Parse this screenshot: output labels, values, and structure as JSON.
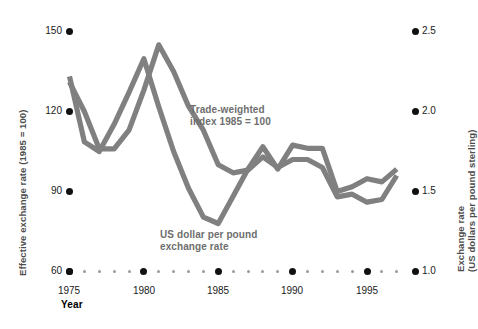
{
  "chart_data": {
    "type": "line",
    "title": "",
    "xlabel": "Year",
    "grid": false,
    "legend_position": "inline-annotations",
    "x": [
      1975,
      1976,
      1977,
      1978,
      1979,
      1980,
      1981,
      1982,
      1983,
      1984,
      1985,
      1986,
      1987,
      1988,
      1989,
      1990,
      1991,
      1992,
      1993,
      1994,
      1995,
      1996,
      1997
    ],
    "axes": {
      "left": {
        "label": "Effective exchange rate (1985 = 100)",
        "ticks": [
          60,
          90,
          120,
          150
        ],
        "tick_labels": [
          "60",
          "90",
          "120",
          "150"
        ],
        "lim": [
          60,
          150
        ]
      },
      "right": {
        "label_line1": "Exchange rate",
        "label_line2": "(US dollars per pound sterling)",
        "label": "Exchange rate (US dollars per pound sterling)",
        "ticks": [
          1.0,
          1.5,
          2.0,
          2.5
        ],
        "tick_labels": [
          "1.0",
          "1.5",
          "2.0",
          "2.5"
        ],
        "lim": [
          1.0,
          2.5
        ]
      },
      "x": {
        "major_ticks": [
          1975,
          1980,
          1985,
          1990,
          1995
        ],
        "major_tick_labels": [
          "1975",
          "1980",
          "1985",
          "1990",
          "1995"
        ],
        "minor_ticks": [
          1976,
          1977,
          1978,
          1979,
          1981,
          1982,
          1983,
          1984,
          1986,
          1987,
          1988,
          1989,
          1991,
          1992,
          1993,
          1994,
          1996,
          1997
        ],
        "lim": [
          1974,
          1997.5
        ]
      }
    },
    "series": [
      {
        "name": "Trade-weighted index 1985 = 100",
        "axis": "left",
        "color": "#808080",
        "annotation": "Trade-weighted\nindex 1985 = 100",
        "values": [
          131,
          120,
          106,
          106,
          113,
          128,
          145,
          135,
          122,
          113,
          100,
          97,
          98,
          103,
          99,
          102,
          102,
          99,
          88,
          89,
          86,
          87,
          96
        ]
      },
      {
        "name": "US dollar per pound exchange rate",
        "axis": "right",
        "color": "#808080",
        "annotation": "US dollar per pound\nexchange rate",
        "values": [
          2.22,
          1.81,
          1.75,
          1.92,
          2.12,
          2.33,
          2.03,
          1.75,
          1.52,
          1.34,
          1.3,
          1.47,
          1.64,
          1.78,
          1.64,
          1.79,
          1.77,
          1.77,
          1.5,
          1.53,
          1.58,
          1.56,
          1.64
        ]
      }
    ]
  },
  "labels": {
    "x_axis_title": "Year",
    "left_axis_title": "Effective exchange rate (1985 = 100)",
    "right_axis_title_line1": "Exchange rate",
    "right_axis_title_line2": "(US dollars per pound sterling)",
    "annotation_trade_weighted": "Trade-weighted\nindex 1985 = 100",
    "annotation_us_dollar": "US dollar per pound\nexchange rate",
    "y_left_150": "150",
    "y_left_120": "120",
    "y_left_90": "90",
    "y_left_60": "60",
    "y_right_25": "2.5",
    "y_right_20": "2.0",
    "y_right_15": "1.5",
    "y_right_10": "1.0",
    "x_1975": "1975",
    "x_1980": "1980",
    "x_1985": "1985",
    "x_1990": "1990",
    "x_1995": "1995"
  },
  "style": {
    "line_color": "#808080",
    "tick_dot_color": "#111111",
    "minor_dot_color": "#9a9a9a",
    "annotation_color": "#6e6e6e",
    "background": "#ffffff"
  }
}
